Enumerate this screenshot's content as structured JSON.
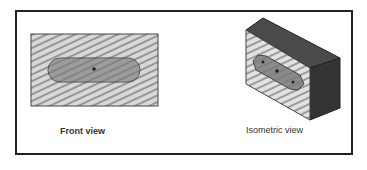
{
  "figure": {
    "front_view": {
      "label": "Front view"
    },
    "isometric_view": {
      "label": "Isometric view"
    }
  },
  "colors": {
    "frame": "#222222",
    "face_fill": "#d8d8d8",
    "hatch": "#555555",
    "slot_fill": "#7a7a7a",
    "top_face": "#4a4a4a",
    "side_face": "#333333"
  }
}
